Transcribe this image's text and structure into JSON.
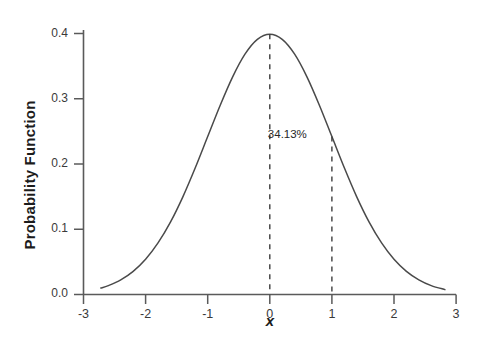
{
  "chart_data": {
    "type": "line",
    "title": "",
    "subtitle": "",
    "xlabel": "x",
    "ylabel": "Probability Function",
    "xlim": [
      -3,
      3
    ],
    "ylim": [
      0.0,
      0.4
    ],
    "grid": false,
    "legend": "none",
    "distribution": "standard normal (mean 0, sd 1)",
    "x_ticks": [
      "-3",
      "-2",
      "-1",
      "0",
      "1",
      "2",
      "3"
    ],
    "x_tick_values": [
      -3,
      -2,
      -1,
      0,
      1,
      2,
      3
    ],
    "y_ticks": [
      "0.0",
      "0.1",
      "0.2",
      "0.3",
      "0.4"
    ],
    "y_tick_values": [
      0.0,
      0.1,
      0.2,
      0.3,
      0.4
    ],
    "series": [
      {
        "name": "Probability Function",
        "color": "#4a4a4a",
        "x": [
          -2.72,
          -2.6,
          -2.4,
          -2.2,
          -2.0,
          -1.8,
          -1.6,
          -1.4,
          -1.2,
          -1.0,
          -0.8,
          -0.6,
          -0.4,
          -0.2,
          0.0,
          0.2,
          0.4,
          0.6,
          0.8,
          1.0,
          1.2,
          1.4,
          1.6,
          1.8,
          2.0,
          2.2,
          2.4,
          2.6,
          2.82
        ],
        "y": [
          0.0099,
          0.0136,
          0.0224,
          0.0355,
          0.054,
          0.079,
          0.1109,
          0.1497,
          0.1942,
          0.242,
          0.2897,
          0.3332,
          0.3683,
          0.391,
          0.3989,
          0.391,
          0.3683,
          0.3332,
          0.2897,
          0.242,
          0.1942,
          0.1497,
          0.1109,
          0.079,
          0.054,
          0.0355,
          0.0224,
          0.0136,
          0.0075
        ]
      }
    ],
    "annotations": [
      {
        "name": "area-percentage",
        "text": "34.13%",
        "x": 0.5,
        "y": 0.245
      }
    ],
    "reference_lines": [
      {
        "name": "mean-line",
        "x": 0,
        "y_top": 0.3989,
        "style": "dashed"
      },
      {
        "name": "one-sigma-line",
        "x": 1,
        "y_top": 0.242,
        "style": "dashed"
      }
    ],
    "colors": {
      "curve": "#4a4a4a",
      "axis": "#5a5a5a",
      "dashed": "#3d3d3d",
      "text": "#1c1c1c",
      "background": "#ffffff"
    }
  }
}
